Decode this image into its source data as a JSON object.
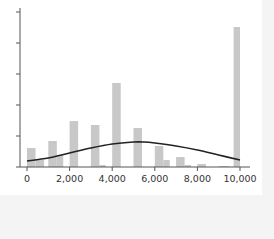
{
  "chart_data": {
    "type": "bar",
    "subtype": "histogram_with_density_curve",
    "title": "",
    "xlabel": "",
    "ylabel": "",
    "xlim": [
      0,
      10000
    ],
    "x_ticks": [
      0,
      2000,
      4000,
      6000,
      8000,
      10000
    ],
    "x_tick_labels": [
      "0",
      "2,000",
      "4,000",
      "6,000",
      "8,000",
      "10,000"
    ],
    "y_tick_count": 6,
    "y_tick_labels": [],
    "grid": false,
    "legend": null,
    "bar_color": "#c8c8c8",
    "curve_color": "#222222",
    "bins": [
      {
        "x0": 0,
        "x1": 400,
        "height": 19
      },
      {
        "x0": 400,
        "x1": 800,
        "height": 7
      },
      {
        "x0": 1000,
        "x1": 1400,
        "height": 26
      },
      {
        "x0": 1400,
        "x1": 1700,
        "height": 12
      },
      {
        "x0": 2000,
        "x1": 2400,
        "height": 46
      },
      {
        "x0": 3000,
        "x1": 3400,
        "height": 42
      },
      {
        "x0": 3400,
        "x1": 3700,
        "height": 2
      },
      {
        "x0": 4000,
        "x1": 4400,
        "height": 84
      },
      {
        "x0": 5000,
        "x1": 5400,
        "height": 39
      },
      {
        "x0": 6000,
        "x1": 6400,
        "height": 21
      },
      {
        "x0": 6400,
        "x1": 6700,
        "height": 7
      },
      {
        "x0": 7000,
        "x1": 7400,
        "height": 10
      },
      {
        "x0": 7400,
        "x1": 7700,
        "height": 2
      },
      {
        "x0": 8000,
        "x1": 8400,
        "height": 3
      },
      {
        "x0": 9000,
        "x1": 9500,
        "height": 1
      },
      {
        "x0": 9700,
        "x1": 10000,
        "height": 140
      }
    ],
    "density_curve": {
      "x": [
        0,
        1000,
        2000,
        3000,
        4000,
        5000,
        5500,
        6000,
        7000,
        8000,
        9000,
        10000
      ],
      "height": [
        6,
        9,
        14,
        19,
        23,
        25,
        25,
        24,
        21,
        17,
        12,
        7
      ]
    }
  }
}
